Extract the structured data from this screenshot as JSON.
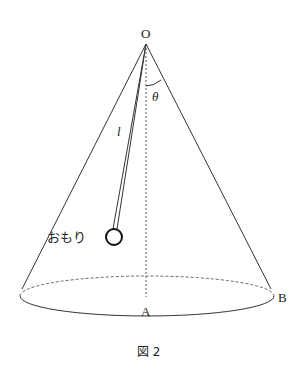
{
  "diagram": {
    "labels": {
      "apex": "O",
      "angle": "θ",
      "string_length": "l",
      "weight": "おもり",
      "base_center": "A",
      "base_edge": "B"
    },
    "caption": "図 2",
    "colors": {
      "line": "#333333",
      "dashed": "#555555",
      "weight_stroke": "#111111"
    }
  }
}
